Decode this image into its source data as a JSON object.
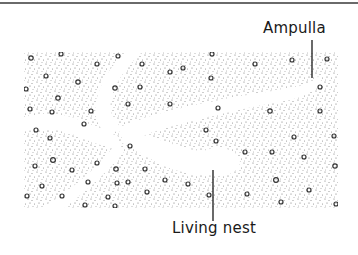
{
  "diagram": {
    "type": "cross-section illustration",
    "labels": {
      "ampulla": "Ampulla",
      "living_nest": "Living nest"
    },
    "colors": {
      "stipple": "#6e6e6e",
      "pebble_outline": "#333333",
      "tunnel": "#ffffff",
      "rule": "#6a6a6a",
      "text": "#1a1a1a"
    }
  }
}
